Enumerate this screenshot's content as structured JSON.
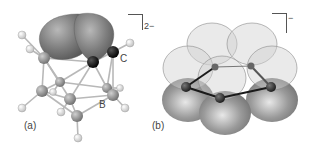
{
  "figure": {
    "panels": [
      {
        "id": "a",
        "label": "(a)",
        "charge": "2−",
        "atom_labels": {
          "carbon": "C",
          "boron": "B"
        },
        "description": "closo-carborane cluster with two large grey orbital lobes above the C–C edge"
      },
      {
        "id": "b",
        "label": "(b)",
        "charge": "−",
        "description": "five-membered ring with translucent upper p-orbital lobes and solid grey lower lobes"
      }
    ],
    "colors": {
      "lobe_dark": "#7a7a7a",
      "lobe_light": "#d6d6d6",
      "carbon_atom": "#111111",
      "boron_atom": "#8c8c8c",
      "hydrogen_atom": "#eeeeee",
      "bond": "#b5b5b5"
    }
  }
}
